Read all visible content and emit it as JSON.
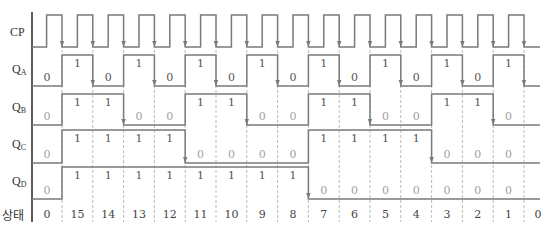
{
  "diagram": {
    "type": "timing-diagram",
    "signals": [
      {
        "name": "CP",
        "label_main": "CP",
        "label_sub": ""
      },
      {
        "name": "QA",
        "label_main": "Q",
        "label_sub": "A"
      },
      {
        "name": "QB",
        "label_main": "Q",
        "label_sub": "B"
      },
      {
        "name": "QC",
        "label_main": "Q",
        "label_sub": "C"
      },
      {
        "name": "QD",
        "label_main": "Q",
        "label_sub": "D"
      }
    ],
    "state_row_label": "상태",
    "states": [
      "0",
      "15",
      "14",
      "13",
      "12",
      "11",
      "10",
      "9",
      "8",
      "7",
      "6",
      "5",
      "4",
      "3",
      "2",
      "1",
      "0"
    ],
    "bits": {
      "QA": [
        "0",
        "1",
        "0",
        "1",
        "0",
        "1",
        "0",
        "1",
        "0",
        "1",
        "0",
        "1",
        "0",
        "1",
        "0",
        "1"
      ],
      "QB": [
        "0",
        "1",
        "1",
        "0",
        "0",
        "1",
        "1",
        "0",
        "0",
        "1",
        "1",
        "0",
        "0",
        "1",
        "1",
        "0"
      ],
      "QC": [
        "0",
        "1",
        "1",
        "1",
        "1",
        "0",
        "0",
        "0",
        "0",
        "1",
        "1",
        "1",
        "1",
        "0",
        "0",
        "0"
      ],
      "QD": [
        "0",
        "1",
        "1",
        "1",
        "1",
        "1",
        "1",
        "1",
        "1",
        "0",
        "0",
        "0",
        "0",
        "0",
        "0",
        "0"
      ]
    },
    "colors": {
      "waveform": "#7a7a7a",
      "axis": "#333333",
      "dashed": "#bbbbbb",
      "bit_text": "#555555",
      "bit_text_faded": "#a0a0a0"
    }
  }
}
